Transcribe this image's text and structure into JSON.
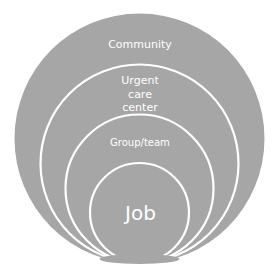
{
  "diagram": {
    "type": "nested-circles",
    "fill_color": "#a6a6a6",
    "ring_color": "#ffffff",
    "text_color": "#ffffff",
    "levels": [
      {
        "id": "community",
        "label_lines": [
          "Community"
        ]
      },
      {
        "id": "urgent-care-center",
        "label_lines": [
          "Urgent",
          "care",
          "center"
        ]
      },
      {
        "id": "group-team",
        "label_lines": [
          "Group/team"
        ]
      },
      {
        "id": "job",
        "label_lines": [
          "Job"
        ]
      }
    ]
  }
}
